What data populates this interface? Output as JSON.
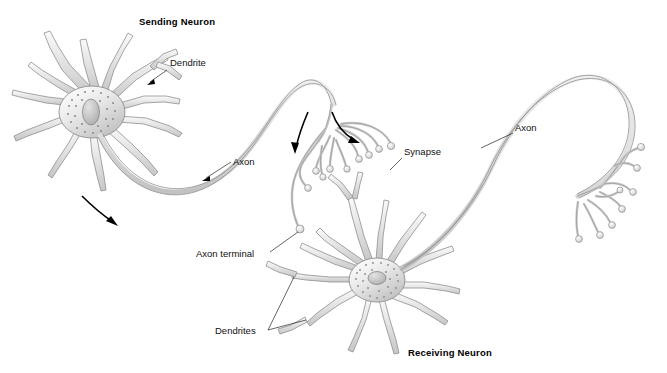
{
  "diagram": {
    "title_sending": "Sending Neuron",
    "title_receiving": "Receiving Neuron",
    "labels": {
      "dendrite": "Dendrite",
      "axon_left": "Axon",
      "axon_right": "Axon",
      "synapse": "Synapse",
      "axon_terminal": "Axon terminal",
      "dendrites": "Dendrites"
    },
    "colors": {
      "background": "#ffffff",
      "outline": "#8f8f8f",
      "fill_light": "#f2f2f2",
      "fill_mid": "#d8d8d8",
      "fill_dark": "#b4b4b4",
      "text": "#111111",
      "arrow": "#000000"
    },
    "icons": {
      "signal_arrow_axon": "curved-arrow-icon",
      "signal_arrow_terminal_left": "curved-arrow-icon",
      "signal_arrow_terminal_right": "curved-arrow-icon"
    }
  }
}
